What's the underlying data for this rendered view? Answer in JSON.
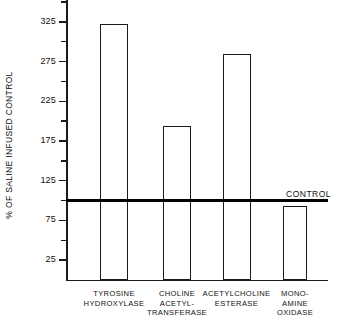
{
  "chart_data": {
    "type": "bar",
    "title": "",
    "subtitle": "",
    "xlabel": "",
    "ylabel": "% OF SALINE INFUSED CONTROL",
    "ylim": [
      0,
      350
    ],
    "grid": false,
    "legend_position": "none",
    "categories": [
      "TYROSINE HYDROXYLASE",
      "CHOLINE ACETYL-TRANSFERASE",
      "ACETYLCHOLINE ESTERASE",
      "MONO-AMINE OXIDASE"
    ],
    "values": [
      322,
      194,
      285,
      93
    ],
    "y_tick_labels": [
      "325",
      "275",
      "225",
      "175",
      "125",
      "75",
      "25"
    ],
    "y_tick_values": [
      325,
      275,
      225,
      175,
      125,
      75,
      25
    ],
    "y_minor_tick_values": [
      350,
      300,
      250,
      200,
      150,
      100,
      50
    ],
    "reference_line": {
      "label": "CONTROL",
      "value": 100
    }
  },
  "axis": {
    "y_title": "% OF SALINE INFUSED CONTROL"
  },
  "categories_display": [
    {
      "line1": "TYROSINE",
      "line2": "HYDROXYLASE",
      "line3": ""
    },
    {
      "line1": "CHOLINE",
      "line2": "ACETYL-",
      "line3": "TRANSFERASE"
    },
    {
      "line1": "ACETYLCHOLINE",
      "line2": "ESTERASE",
      "line3": ""
    },
    {
      "line1": "MONO-",
      "line2": "AMINE",
      "line3": "OXIDASE"
    }
  ],
  "colors": {
    "ink": "#1a1a1a",
    "bar_fill": "#ffffff",
    "control_line": "#000000",
    "background": "#ffffff"
  }
}
